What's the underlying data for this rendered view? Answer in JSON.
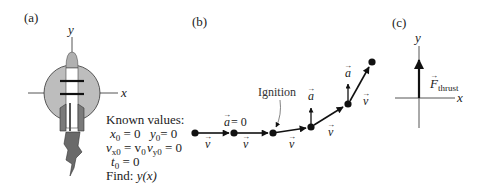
{
  "panels": {
    "a": {
      "label": "(a)",
      "axis_y": "y",
      "axis_x": "x",
      "known_values": {
        "title": "Known values:",
        "x0": "x",
        "x0_sub": "0",
        "x0_val": " = 0",
        "y0": "y",
        "y0_sub": "0",
        "y0_val": "= 0",
        "vx0": "v",
        "vx0_sub": "x0",
        "vx0_eq": " = v",
        "vx0_eq_sub": "0",
        "vy0": "v",
        "vy0_sub": "y0",
        "vy0_val": " = 0",
        "t0": "t",
        "t0_sub": "0",
        "t0_val": " = 0",
        "find_label": "Find: ",
        "find_expr": "y(x)"
      }
    },
    "b": {
      "label": "(b)",
      "accel_zero": "a",
      "accel_zero_val": " = 0",
      "velocity_symbol": "v",
      "accel_symbol": "a",
      "ignition_label": "Ignition",
      "points": [
        {
          "x": 195,
          "y": 133
        },
        {
          "x": 234,
          "y": 133
        },
        {
          "x": 273,
          "y": 133
        },
        {
          "x": 311,
          "y": 127
        },
        {
          "x": 348,
          "y": 104
        },
        {
          "x": 372,
          "y": 62
        }
      ]
    },
    "c": {
      "label": "(c)",
      "axis_y": "y",
      "axis_x": "x",
      "force_symbol": "F",
      "force_sub": "thrust"
    }
  },
  "colors": {
    "ink": "#111111",
    "axis": "#555555",
    "circle_fill": "#bdbdbd",
    "rocket_body": "#ffffff",
    "nose": "#b0b0b0",
    "nozzle": "#7a7a7a",
    "flame": "#6a6a6a"
  }
}
